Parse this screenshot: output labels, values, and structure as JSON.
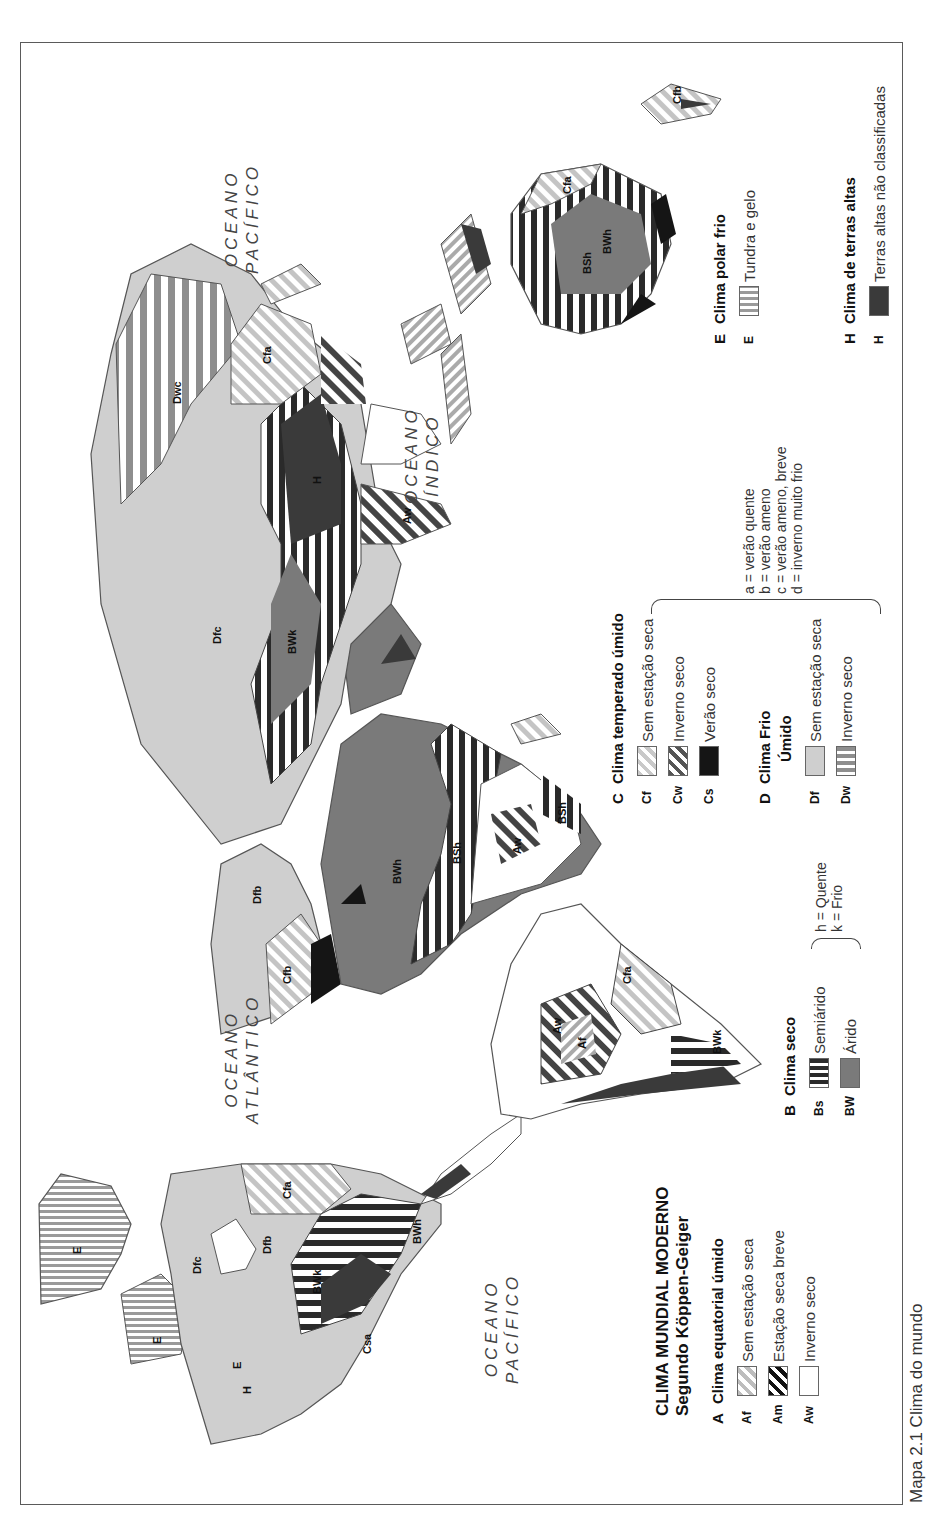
{
  "title": {
    "line1": "CLIMA MUNDIAL MODERNO",
    "line2": "Segundo Köppen-Geiger"
  },
  "caption": "Mapa 2.1  Clima do mundo",
  "oceans": [
    {
      "name": "pacific-left",
      "line1": "OCEANO",
      "line2": "PACÍFICO"
    },
    {
      "name": "atlantic",
      "line1": "OCEANO",
      "line2": "ATLÂNTICO"
    },
    {
      "name": "indian",
      "line1": "OCEANO",
      "line2": "ÍNDICO"
    },
    {
      "name": "pacific-right",
      "line1": "OCEANO",
      "line2": "PACÍFICO"
    }
  ],
  "legend": {
    "A": {
      "letter": "A",
      "heading": "Clima equatorial úmido",
      "items": [
        {
          "code": "Af",
          "label": "Sem estação seca"
        },
        {
          "code": "Am",
          "label": "Estação seca breve"
        },
        {
          "code": "Aw",
          "label": "Inverno seco"
        }
      ]
    },
    "B": {
      "letter": "B",
      "heading": "Clima seco",
      "items": [
        {
          "code": "Bs",
          "label": "Semiárido"
        },
        {
          "code": "BW",
          "label": "Árido"
        }
      ],
      "notes": [
        "h = Quente",
        "k = Frio"
      ]
    },
    "C": {
      "letter": "C",
      "heading": "Clima temperado úmido",
      "items": [
        {
          "code": "Cf",
          "label": "Sem estação seca"
        },
        {
          "code": "Cw",
          "label": "Inverno seco"
        },
        {
          "code": "Cs",
          "label": "Verão seco"
        }
      ]
    },
    "D": {
      "letter": "D",
      "heading_line1": "Clima Frio",
      "heading_line2": "Úmido",
      "items": [
        {
          "code": "Df",
          "label": "Sem estação seca"
        },
        {
          "code": "Dw",
          "label": "Inverno seco"
        }
      ]
    },
    "CD_notes": [
      "a = verão quente",
      "b = verão ameno",
      "c = verão ameno, breve",
      "d = inverno muito frio"
    ],
    "E": {
      "letter": "E",
      "heading": "Clima polar frio",
      "items": [
        {
          "code": "E",
          "label": "Tundra e gelo"
        }
      ]
    },
    "H": {
      "letter": "H",
      "heading": "Clima de terras altas",
      "items": [
        {
          "code": "H",
          "label": "Terras altas não classificadas"
        }
      ]
    }
  },
  "colors": {
    "border": "#5a5a5a",
    "arid": "#7a7a7a",
    "cold_humid": "#cfcfcf",
    "highland": "#3a3a3a",
    "summer_dry": "#151515"
  }
}
